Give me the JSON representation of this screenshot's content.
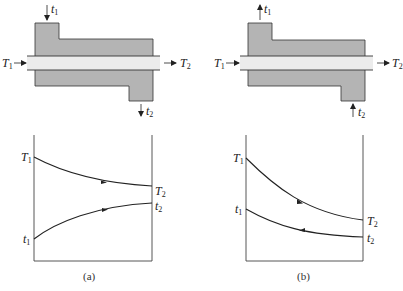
{
  "figure": {
    "panels": [
      {
        "id": "a",
        "caption": "(a)",
        "flow_type": "parallel-flow (co-current)",
        "exchanger": {
          "hot_in": {
            "symbol": "T",
            "sub": "1"
          },
          "hot_out": {
            "symbol": "T",
            "sub": "2"
          },
          "cold_in": {
            "symbol": "t",
            "sub": "1",
            "direction": "down-into-top-nozzle"
          },
          "cold_out": {
            "symbol": "t",
            "sub": "2",
            "direction": "down-out-of-bottom-nozzle"
          }
        },
        "graph": {
          "left_labels": [
            {
              "symbol": "T",
              "sub": "1"
            },
            {
              "symbol": "t",
              "sub": "1"
            }
          ],
          "right_labels": [
            {
              "symbol": "T",
              "sub": "2"
            },
            {
              "symbol": "t",
              "sub": "2"
            }
          ]
        }
      },
      {
        "id": "b",
        "caption": "(b)",
        "flow_type": "counter-flow",
        "exchanger": {
          "hot_in": {
            "symbol": "T",
            "sub": "1"
          },
          "hot_out": {
            "symbol": "T",
            "sub": "2"
          },
          "cold_out": {
            "symbol": "t",
            "sub": "1",
            "direction": "up-out-of-top-nozzle"
          },
          "cold_in": {
            "symbol": "t",
            "sub": "2",
            "direction": "up-into-bottom-nozzle"
          }
        },
        "graph": {
          "left_labels": [
            {
              "symbol": "T",
              "sub": "1"
            },
            {
              "symbol": "t",
              "sub": "1"
            }
          ],
          "right_labels": [
            {
              "symbol": "T",
              "sub": "2"
            },
            {
              "symbol": "t",
              "sub": "2"
            }
          ]
        }
      }
    ],
    "colors": {
      "shell_fill": "#b4b4b4",
      "tube_fill": "#ececec",
      "line": "#333333"
    }
  }
}
